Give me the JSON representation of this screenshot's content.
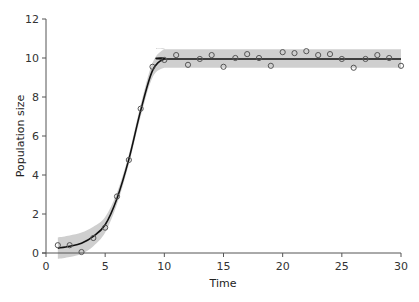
{
  "chart_data": {
    "type": "scatter",
    "title": "",
    "xlabel": "Time",
    "ylabel": "Population size",
    "xlim": [
      0,
      30
    ],
    "ylim": [
      0,
      12
    ],
    "xticks": [
      0,
      5,
      10,
      15,
      20,
      25,
      30
    ],
    "yticks": [
      0,
      2,
      4,
      6,
      8,
      10,
      12
    ],
    "grid": false,
    "legend": null,
    "series": [
      {
        "name": "observed",
        "kind": "scatter",
        "marker": "open-circle",
        "x": [
          1,
          2,
          3,
          4,
          5,
          6,
          7,
          8,
          9,
          10,
          11,
          12,
          13,
          14,
          15,
          16,
          17,
          18,
          19,
          20,
          21,
          22,
          23,
          24,
          25,
          26,
          27,
          28,
          29,
          30
        ],
        "y": [
          0.4,
          0.4,
          0.05,
          0.77,
          1.3,
          2.9,
          4.77,
          7.4,
          9.55,
          9.9,
          10.15,
          9.65,
          9.95,
          10.15,
          9.55,
          10.0,
          10.2,
          10.0,
          9.6,
          10.3,
          10.25,
          10.35,
          10.15,
          10.2,
          9.95,
          9.5,
          9.95,
          10.15,
          10.0,
          9.6
        ]
      },
      {
        "name": "fitted",
        "kind": "line",
        "x": [
          1,
          2,
          3,
          4,
          5,
          6,
          7,
          8,
          9,
          10,
          11,
          30
        ],
        "y": [
          0.25,
          0.35,
          0.5,
          0.85,
          1.45,
          2.8,
          4.8,
          7.3,
          9.35,
          9.95,
          9.95,
          9.95
        ]
      },
      {
        "name": "confidence band",
        "kind": "area",
        "x": [
          1,
          2,
          3,
          4,
          5,
          6,
          7,
          8,
          9,
          10,
          11,
          30
        ],
        "lower": [
          -0.3,
          -0.2,
          -0.05,
          0.35,
          1.05,
          2.5,
          4.55,
          7.0,
          9.0,
          9.5,
          9.5,
          9.5
        ],
        "upper": [
          0.8,
          0.9,
          1.05,
          1.35,
          1.85,
          3.1,
          5.05,
          7.6,
          9.75,
          10.45,
          10.45,
          10.45
        ]
      }
    ],
    "colors": {
      "axis": "#555555",
      "line": "#111111",
      "band": "#cfcfcf",
      "marker": "#555555"
    }
  }
}
